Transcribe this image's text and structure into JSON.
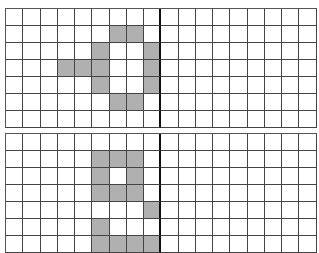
{
  "grids": [
    {
      "name": "top-grid",
      "rows": 7,
      "cols": 18,
      "divider_after_col": 8,
      "fill_color": "#b0b0b0",
      "filled": [
        [
          1,
          6
        ],
        [
          1,
          7
        ],
        [
          2,
          5
        ],
        [
          2,
          8
        ],
        [
          3,
          3
        ],
        [
          3,
          4
        ],
        [
          3,
          5
        ],
        [
          3,
          8
        ],
        [
          4,
          5
        ],
        [
          4,
          8
        ],
        [
          5,
          6
        ],
        [
          5,
          7
        ]
      ]
    },
    {
      "name": "bottom-grid",
      "rows": 7,
      "cols": 18,
      "divider_after_col": 8,
      "fill_color": "#b0b0b0",
      "filled": [
        [
          1,
          5
        ],
        [
          1,
          6
        ],
        [
          1,
          7
        ],
        [
          2,
          5
        ],
        [
          2,
          7
        ],
        [
          3,
          5
        ],
        [
          3,
          6
        ],
        [
          3,
          7
        ],
        [
          4,
          8
        ],
        [
          5,
          5
        ],
        [
          6,
          5
        ],
        [
          6,
          6
        ],
        [
          6,
          7
        ],
        [
          6,
          8
        ]
      ]
    }
  ]
}
